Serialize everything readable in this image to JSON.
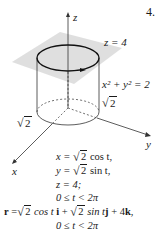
{
  "figure": {
    "number": "4.",
    "axes": {
      "x": "x",
      "y": "y",
      "z": "z"
    },
    "labels": {
      "plane": "z = 4",
      "cylinder": "x² + y² = 2",
      "radius_right": "2",
      "radius_left": "2"
    },
    "colors": {
      "plane": "#d9d9d9",
      "lines": "#333333",
      "curve": "#111111"
    }
  },
  "equations": {
    "x_eq": {
      "lhs": "x = ",
      "rad": "2",
      "rhs": " cos t,"
    },
    "y_eq": {
      "lhs": "y = ",
      "rad": "2",
      "rhs": " sin t,"
    },
    "z_eq": "z = 4;",
    "range1": "0 ≤ t < 2π",
    "vector": {
      "r": "r",
      "eq": " =",
      "rad1": "2",
      "mid1": " cos t ",
      "i": "i",
      "plus1": " + ",
      "rad2": "2",
      "mid2": " sin t",
      "j": "j",
      "plus2": " + 4",
      "k": "k",
      "end": ","
    },
    "range2": "0 ≤ t < 2π"
  }
}
